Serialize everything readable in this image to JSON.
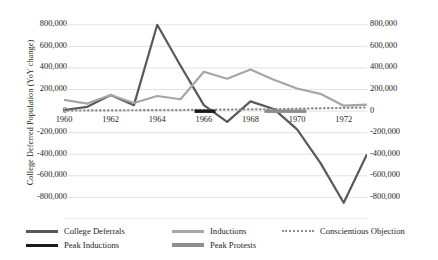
{
  "axes": {
    "y_left_title": "College Deferred Population (YoY change)",
    "y_right_title": "Annual Draft",
    "y_ticks": [
      "800,000",
      "600,000",
      "400,000",
      "200,000",
      "0",
      "-200,000",
      "-400,000",
      "-600,000",
      "-800,000"
    ],
    "x_ticks": [
      "1960",
      "1962",
      "1964",
      "1966",
      "1968",
      "1970",
      "1972"
    ]
  },
  "legend": {
    "items": [
      {
        "label": "College Deferrals",
        "color": "#595959",
        "style": "solid"
      },
      {
        "label": "Inductions",
        "color": "#a6a6a6",
        "style": "solid"
      },
      {
        "label": "Conscientious Objection",
        "color": "#8c8c8c",
        "style": "dotted"
      },
      {
        "label": "Peak Inductions",
        "color": "#1a1a1a",
        "style": "solid"
      },
      {
        "label": "Peak Protests",
        "color": "#8c8c8c",
        "style": "solid"
      }
    ]
  },
  "chart_data": {
    "type": "line",
    "title": "",
    "xlabel": "",
    "ylabel": "College Deferred Population (YoY change)",
    "y2label": "Annual Draft",
    "ylim": [
      -1000000,
      900000
    ],
    "xlim": [
      1960,
      1973
    ],
    "grid": true,
    "legend_position": "bottom",
    "x": [
      1960,
      1961,
      1962,
      1963,
      1964,
      1965,
      1966,
      1967,
      1968,
      1969,
      1970,
      1971,
      1972,
      1973
    ],
    "series": [
      {
        "name": "College Deferrals",
        "color": "#595959",
        "style": "solid",
        "values": [
          10000,
          40000,
          150000,
          55000,
          800000,
          420000,
          55000,
          -100000,
          90000,
          20000,
          -170000,
          -480000,
          -850000,
          -400000
        ]
      },
      {
        "name": "Inductions",
        "color": "#a6a6a6",
        "style": "solid",
        "values": [
          105000,
          70000,
          150000,
          75000,
          140000,
          110000,
          365000,
          300000,
          385000,
          290000,
          210000,
          160000,
          50000,
          60000
        ]
      },
      {
        "name": "Conscientious Objection",
        "color": "#8c8c8c",
        "style": "dotted",
        "values": [
          5000,
          6000,
          7000,
          8000,
          9000,
          10000,
          12000,
          14000,
          16000,
          18000,
          22000,
          26000,
          30000,
          34000
        ]
      }
    ],
    "annotations": [
      {
        "name": "Peak Inductions",
        "color": "#1a1a1a",
        "x_start": 1965.6,
        "x_end": 1966.5,
        "y": 0
      },
      {
        "name": "Peak Protests",
        "color": "#8c8c8c",
        "x_start": 1968.6,
        "x_end": 1970.4,
        "y": 0
      }
    ]
  }
}
